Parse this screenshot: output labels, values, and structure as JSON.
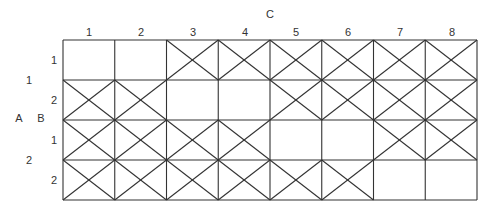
{
  "diagram": {
    "factor_c_label": "C",
    "factor_a_label": "A",
    "factor_b_label": "B",
    "columns": [
      "1",
      "2",
      "3",
      "4",
      "5",
      "6",
      "7",
      "8"
    ],
    "a_levels": [
      "1",
      "2"
    ],
    "b_levels": [
      "1",
      "2",
      "1",
      "2"
    ],
    "rows": [
      {
        "a": "1",
        "b": "1",
        "crossed": [
          false,
          false,
          true,
          true,
          true,
          true,
          true,
          true
        ]
      },
      {
        "a": "1",
        "b": "2",
        "crossed": [
          true,
          true,
          false,
          false,
          true,
          true,
          true,
          true
        ]
      },
      {
        "a": "2",
        "b": "1",
        "crossed": [
          true,
          true,
          true,
          true,
          false,
          false,
          true,
          true
        ]
      },
      {
        "a": "2",
        "b": "2",
        "crossed": [
          true,
          true,
          true,
          true,
          true,
          true,
          false,
          false
        ]
      }
    ],
    "colors": {
      "line": "#333333",
      "text": "#333333",
      "background": "#ffffff"
    }
  }
}
